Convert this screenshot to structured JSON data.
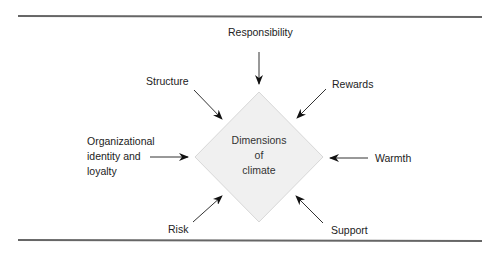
{
  "diagram": {
    "center": {
      "lines": [
        "Dimensions",
        "of",
        "climate"
      ]
    },
    "inputs": [
      {
        "id": "responsibility",
        "label": "Responsibility"
      },
      {
        "id": "structure",
        "label": "Structure"
      },
      {
        "id": "rewards",
        "label": "Rewards"
      },
      {
        "id": "organizational-identity",
        "label": "Organizational identity and loyalty",
        "lines": [
          "Organizational",
          "identity and",
          "loyalty"
        ]
      },
      {
        "id": "warmth",
        "label": "Warmth"
      },
      {
        "id": "risk",
        "label": "Risk"
      },
      {
        "id": "support",
        "label": "Support"
      }
    ],
    "colors": {
      "diamond_fill": "#f0f0f0",
      "diamond_stroke": "#d8d8d8",
      "rule": "#666666",
      "arrow": "#222222"
    }
  }
}
